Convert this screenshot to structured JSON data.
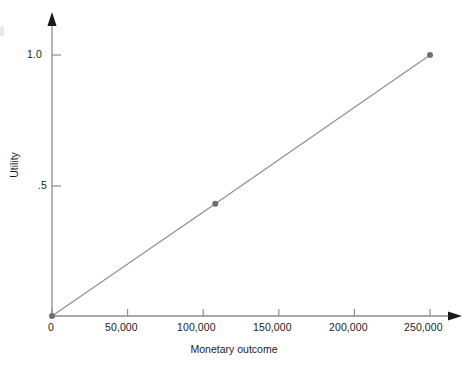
{
  "chart_data": {
    "type": "line",
    "title": "",
    "subtitle": "",
    "xlabel": "Monetary outcome",
    "ylabel": "Utility",
    "xlim": [
      0,
      250000
    ],
    "ylim": [
      0,
      1.0
    ],
    "grid": false,
    "legend": null,
    "x_ticks": [
      {
        "value": 0,
        "label": "0"
      },
      {
        "value": 50000,
        "label": "50,000"
      },
      {
        "value": 100000,
        "label": "100,000"
      },
      {
        "value": 150000,
        "label": "150,000"
      },
      {
        "value": 200000,
        "label": "200,000"
      },
      {
        "value": 250000,
        "label": "250,000"
      }
    ],
    "y_ticks": [
      {
        "value": 0.5,
        "label": ".5"
      },
      {
        "value": 1.0,
        "label": "1.0"
      }
    ],
    "series": [
      {
        "name": "Utility function",
        "x": [
          0,
          108000,
          250000
        ],
        "values": [
          0,
          0.43,
          1.0
        ],
        "marker": "circle",
        "line_color": "#8c8c8c",
        "marker_color": "#6e6e6e"
      }
    ],
    "annotations": []
  },
  "axes": {
    "x_axis_color": "#8c8c8c",
    "y_axis_color": "#8c8c8c",
    "arrow_color": "#1a1a1a",
    "tick_color": "#8c8c8c"
  }
}
